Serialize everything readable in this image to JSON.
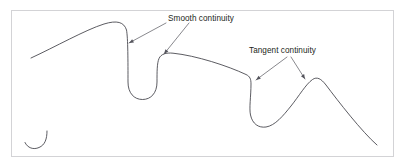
{
  "figure": {
    "background_color": "#ffffff",
    "frame": {
      "name": "figure-border",
      "x": 11.5,
      "y": 10.5,
      "width": 382,
      "height": 146,
      "stroke_color": "#d3d3d6"
    },
    "curve_color": "#3f3f46",
    "leader_color": "#54545c",
    "text_color": "#231f20"
  },
  "annotations": [
    {
      "id": "smooth-continuity",
      "label": "Smooth continuity",
      "text_x": 168,
      "text_y": 21,
      "leaders": [
        {
          "from_x": 166,
          "from_y": 23,
          "to_x": 129,
          "to_y": 43,
          "arrow_angle_deg": 208
        },
        {
          "from_x": 189,
          "from_y": 23,
          "to_x": 164,
          "to_y": 54,
          "arrow_angle_deg": 231
        }
      ]
    },
    {
      "id": "tangent-continuity",
      "label": "Tangent continuity",
      "text_x": 249,
      "text_y": 53,
      "leaders": [
        {
          "from_x": 287,
          "from_y": 57,
          "to_x": 256,
          "to_y": 80,
          "arrow_angle_deg": 216
        },
        {
          "from_x": 291,
          "from_y": 57,
          "to_x": 305,
          "to_y": 79,
          "arrow_angle_deg": 302
        }
      ]
    }
  ],
  "curves": [
    {
      "id": "main-continuity-curve",
      "name": "main-curve",
      "description": "Long spline with a smooth-continuity U dip and a tangent-continuity V dip",
      "path": "M 31 58 C 55 47 85 30 104 24 C 117 20 124 22 126.5 30 C 128 38 128 62 128 82 C 128 93 134 99.5 142.5 99.5 C 151 99.5 157 93 157 82 C 157 72 157 63 159 58.5 C 161 54 166 52.5 173 53.2 C 196 55.5 228 66 246 74.5 C 250 76.4 251 79 251 84 C 251 96 249 108 250.5 115 C 252.5 124 258.5 128 266 127 C 275 125.6 283 116 291 106 C 299 96 306 84 312.5 79.5 C 317 76.5 321 78.5 326 85 C 338 101 362 132 377 145"
    },
    {
      "id": "hook-mark",
      "name": "hook-curve",
      "description": "Small J-shaped hook near bottom-left corner",
      "path": "M 47 131 C 47 139 45 145 39 147.5 C 33.5 150 27.5 148 25 142.5"
    }
  ]
}
